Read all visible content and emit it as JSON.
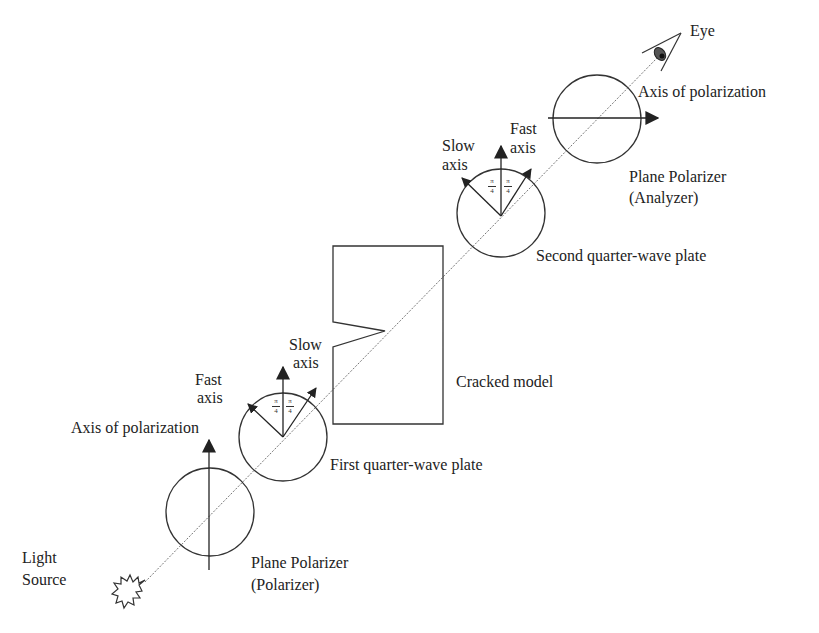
{
  "diagram": {
    "type": "circular-polariscope-setup",
    "line_color": "#333333",
    "beam_color": "#666666",
    "components": [
      {
        "id": "light_source",
        "label_lines": [
          "Light",
          "Source"
        ]
      },
      {
        "id": "polarizer",
        "label_lines": [
          "Plane Polarizer",
          "(Polarizer)"
        ],
        "axis_label": "Axis of polarization"
      },
      {
        "id": "first_qwp",
        "label": "First quarter-wave plate",
        "fast_axis_label": [
          "Fast",
          "axis"
        ],
        "slow_axis_label": [
          "Slow",
          "axis"
        ],
        "angle_label": "π/4"
      },
      {
        "id": "model",
        "label": "Cracked model"
      },
      {
        "id": "second_qwp",
        "label": "Second quarter-wave plate",
        "fast_axis_label": [
          "Fast",
          "axis"
        ],
        "slow_axis_label": [
          "Slow",
          "axis"
        ],
        "angle_label": "π/4"
      },
      {
        "id": "analyzer",
        "label_lines": [
          "Plane Polarizer",
          "(Analyzer)"
        ],
        "axis_label": "Axis of polarization"
      },
      {
        "id": "eye",
        "label": "Eye"
      }
    ]
  },
  "labels": {
    "light_source_1": "Light",
    "light_source_2": "Source",
    "polarizer_1": "Plane Polarizer",
    "polarizer_2": "(Polarizer)",
    "polarizer_axis": "Axis of polarization",
    "qwp1_fast_1": "Fast",
    "qwp1_fast_2": "axis",
    "qwp1_slow_1": "Slow",
    "qwp1_slow_2": "axis",
    "qwp1": "First quarter-wave plate",
    "model": "Cracked model",
    "qwp2_slow_1": "Slow",
    "qwp2_slow_2": "axis",
    "qwp2_fast_1": "Fast",
    "qwp2_fast_2": "axis",
    "qwp2": "Second quarter-wave plate",
    "analyzer_1": "Plane Polarizer",
    "analyzer_2": "(Analyzer)",
    "analyzer_axis": "Axis of polarization",
    "eye": "Eye",
    "pi": "π",
    "four": "4"
  }
}
